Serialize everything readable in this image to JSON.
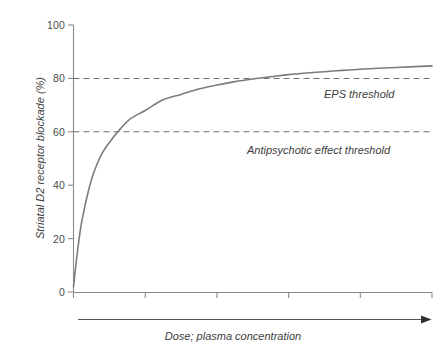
{
  "chart_data": {
    "type": "line",
    "title": "",
    "xlabel": "Dose; plasma concentration",
    "ylabel": "Striatal D2 receptor blockade (%)",
    "xlim": [
      0,
      100
    ],
    "ylim": [
      0,
      100
    ],
    "grid": false,
    "legend": "none",
    "y_ticks": [
      "100",
      "80",
      "60",
      "40",
      "20",
      "0"
    ],
    "y_tick_values": [
      100,
      80,
      60,
      40,
      20,
      0
    ],
    "x_ticks": [
      "",
      "",
      "",
      "",
      "",
      ""
    ],
    "x_tick_values": [
      0,
      20,
      40,
      60,
      80,
      100
    ],
    "x_axis_arrow": true,
    "series": [
      {
        "name": "Striatal D2 receptor blockade",
        "color": "#7c7c7c",
        "x": [
          0,
          1,
          2,
          3,
          4,
          5,
          6,
          8,
          10,
          13,
          16,
          20,
          25,
          30,
          35,
          40,
          45,
          50,
          55,
          60,
          65,
          70,
          75,
          80,
          85,
          90,
          95,
          100
        ],
        "values": [
          2,
          14,
          24,
          31,
          37,
          42,
          46,
          52,
          56,
          61,
          65,
          68,
          72,
          74,
          76,
          77.5,
          78.8,
          79.8,
          80.6,
          81.4,
          82,
          82.5,
          83,
          83.4,
          83.8,
          84.1,
          84.4,
          84.7
        ]
      }
    ],
    "annotations": [
      {
        "name": "eps-threshold",
        "label": "EPS threshold",
        "y_value": 80,
        "style": "dashed"
      },
      {
        "name": "antipsychotic-effect-threshold",
        "label": "Antipsychotic effect threshold",
        "y_value": 60,
        "style": "dashed"
      }
    ],
    "colors": {
      "curve": "#7c7c7c",
      "axis": "#8a8a8a",
      "threshold": "#6e6e6e",
      "text": "#3d3d3d"
    }
  },
  "axes": {
    "y_title": "Striatal D2 receptor blockade (%)",
    "x_title": "Dose; plasma concentration",
    "y_labels": {
      "t100": "100",
      "t80": "80",
      "t60": "60",
      "t40": "40",
      "t20": "20",
      "t0": "0"
    }
  },
  "thresholds": {
    "eps": "EPS threshold",
    "antipsychotic": "Antipsychotic effect threshold"
  }
}
